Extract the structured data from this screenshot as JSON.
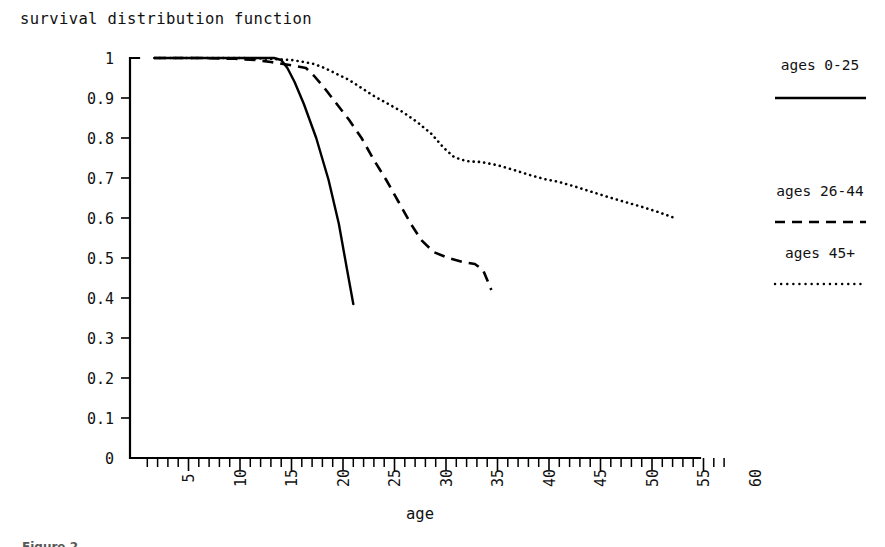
{
  "chart_data": {
    "type": "line",
    "title": "survival distribution function",
    "subtitle": "",
    "xlabel": "age",
    "ylabel": "",
    "xlim": [
      0,
      60
    ],
    "ylim": [
      0,
      1
    ],
    "grid": false,
    "legend_position": "right",
    "x_major_ticks": [
      5,
      10,
      15,
      20,
      25,
      30,
      35,
      40,
      45,
      50,
      55,
      60
    ],
    "x_major_tick_labels": [
      "5",
      "10",
      "15",
      "20",
      "25",
      "30",
      "35",
      "40",
      "45",
      "50",
      "55",
      "60"
    ],
    "x_minor_tick_step": 1,
    "x_minor_tick_end": 57,
    "x_tick_label_rotation": -90,
    "y_ticks": [
      0,
      0.1,
      0.2,
      0.3,
      0.4,
      0.5,
      0.6,
      0.7,
      0.8,
      0.9,
      1
    ],
    "y_tick_labels": [
      "0",
      "0.1",
      "0.2",
      "0.3",
      "0.4",
      "0.5",
      "0.6",
      "0.7",
      "0.8",
      "0.9",
      "1"
    ],
    "series": [
      {
        "name": "ages 0-25",
        "style": "solid",
        "color": "#000000",
        "x": [
          1.7,
          6.0,
          9.0,
          11.0,
          12.5,
          13.3,
          14.0,
          14.6,
          15.3,
          16.2,
          17.4,
          18.6,
          19.6,
          20.4,
          21.0
        ],
        "y": [
          1.0,
          1.0,
          1.0,
          1.0,
          1.0,
          1.0,
          0.995,
          0.975,
          0.94,
          0.885,
          0.8,
          0.695,
          0.585,
          0.47,
          0.385
        ]
      },
      {
        "name": "ages 26-44",
        "style": "dashed",
        "color": "#000000",
        "x": [
          1.7,
          6.0,
          9.5,
          11.5,
          13.0,
          14.2,
          15.4,
          16.4,
          17.2,
          18.2,
          19.4,
          20.6,
          21.8,
          23.0,
          24.2,
          25.4,
          26.6,
          27.6,
          28.8,
          30.2,
          31.6,
          32.8,
          33.6,
          34.4
        ],
        "y": [
          1.0,
          1.0,
          0.998,
          0.995,
          0.99,
          0.985,
          0.98,
          0.975,
          0.955,
          0.925,
          0.885,
          0.845,
          0.8,
          0.745,
          0.695,
          0.64,
          0.585,
          0.545,
          0.515,
          0.5,
          0.49,
          0.485,
          0.47,
          0.42
        ]
      },
      {
        "name": "ages 45+",
        "style": "dotted",
        "color": "#000000",
        "x": [
          1.7,
          6.0,
          10.0,
          13.0,
          15.0,
          16.2,
          17.2,
          18.2,
          19.4,
          20.6,
          21.8,
          23.0,
          24.4,
          25.8,
          27.2,
          28.6,
          29.8,
          30.8,
          32.0,
          33.4,
          35.0,
          36.6,
          38.2,
          39.6,
          41.0,
          42.6,
          44.2,
          45.8,
          47.4,
          49.0,
          50.6,
          52.0
        ],
        "y": [
          1.0,
          1.0,
          1.0,
          0.998,
          0.995,
          0.99,
          0.985,
          0.975,
          0.96,
          0.945,
          0.925,
          0.905,
          0.885,
          0.865,
          0.84,
          0.81,
          0.775,
          0.752,
          0.742,
          0.74,
          0.732,
          0.72,
          0.707,
          0.697,
          0.69,
          0.678,
          0.665,
          0.652,
          0.64,
          0.628,
          0.615,
          0.602
        ]
      }
    ]
  },
  "legend": {
    "entries": [
      {
        "label": "ages 0-25",
        "style": "solid"
      },
      {
        "label": "ages 26-44",
        "style": "dashed"
      },
      {
        "label": "ages 45+",
        "style": "dotted"
      }
    ]
  },
  "caption": {
    "text": "Figure 2"
  }
}
